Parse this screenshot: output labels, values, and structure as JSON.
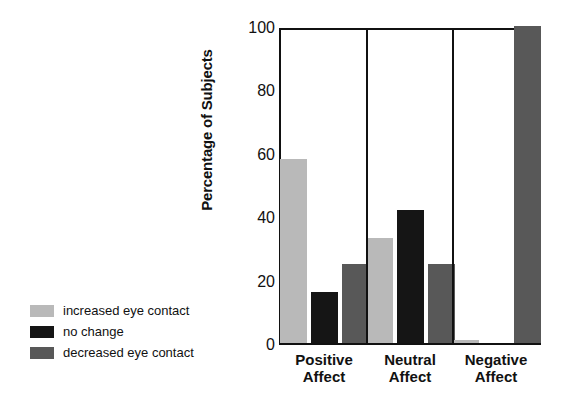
{
  "chart_data": {
    "type": "bar",
    "title": "",
    "xlabel": "",
    "ylabel": "Percentage of Subjects",
    "ylim": [
      0,
      100
    ],
    "yticks": [
      0,
      20,
      40,
      60,
      80,
      100
    ],
    "grid": false,
    "legend_position": "left-outside",
    "categories": [
      "Positive Affect",
      "Neutral Affect",
      "Negative Affect"
    ],
    "category_lines": [
      [
        "Positive",
        "Affect"
      ],
      [
        "Neutral",
        "Affect"
      ],
      [
        "Negative",
        "Affect"
      ]
    ],
    "series": [
      {
        "name": "increased eye contact",
        "color": "#b9b9b9",
        "values": [
          58,
          33,
          1
        ]
      },
      {
        "name": "no change",
        "color": "#151515",
        "values": [
          16,
          42,
          0
        ]
      },
      {
        "name": "decreased eye contact",
        "color": "#585858",
        "values": [
          25,
          25,
          100
        ]
      }
    ]
  },
  "legend": {
    "items": [
      {
        "label": "increased eye contact",
        "swatch": "increased"
      },
      {
        "label": "no change",
        "swatch": "nochange"
      },
      {
        "label": "decreased eye contact",
        "swatch": "decreased"
      }
    ]
  },
  "axis": {
    "y_title": "Percentage of Subjects",
    "y_tick_labels": [
      "100",
      "80",
      "60",
      "40",
      "20",
      "0"
    ]
  }
}
